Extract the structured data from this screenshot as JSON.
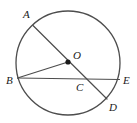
{
  "figure": {
    "name": "circle-with-chords",
    "type": "geometry-diagram",
    "background_color": "#ffffff",
    "stroke_color": "#4d4d4d",
    "label_color": "#1a1a1a",
    "circle": {
      "name": "circle-O",
      "center_label": "O",
      "cx": 68,
      "cy": 63,
      "r": 52,
      "stroke_width": 1.3
    },
    "center_dot": {
      "name": "center-point-O",
      "cx": 68,
      "cy": 62,
      "r": 2.6
    },
    "points": [
      {
        "id": "A",
        "label": "A",
        "x": 33,
        "y": 25.5,
        "label_x": 23,
        "label_y": 18
      },
      {
        "id": "B",
        "label": "B",
        "x": 17.5,
        "y": 78,
        "label_x": 6,
        "label_y": 84
      },
      {
        "id": "O",
        "label": "O",
        "x": 68,
        "y": 62,
        "label_x": 73,
        "label_y": 59
      },
      {
        "id": "C",
        "label": "C",
        "x": 80,
        "y": 79,
        "label_x": 76,
        "label_y": 91
      },
      {
        "id": "D",
        "label": "D",
        "x": 107,
        "y": 99,
        "label_x": 109,
        "label_y": 111
      },
      {
        "id": "E",
        "label": "E",
        "x": 119.5,
        "y": 79.5,
        "label_x": 123,
        "label_y": 84
      }
    ],
    "segments": [
      {
        "name": "chord-AD",
        "from": "A",
        "to": "D",
        "x1": 33,
        "y1": 25.5,
        "x2": 107,
        "y2": 99
      },
      {
        "name": "chord-BE",
        "from": "B",
        "to": "E",
        "x1": 17.5,
        "y1": 78,
        "x2": 119.5,
        "y2": 79.5
      },
      {
        "name": "radius-BO",
        "from": "B",
        "to": "O",
        "x1": 17.5,
        "y1": 78,
        "x2": 68,
        "y2": 62
      }
    ],
    "intersection": {
      "name": "intersection-C",
      "label": "C",
      "of": "chord-AD and chord-BE"
    }
  }
}
